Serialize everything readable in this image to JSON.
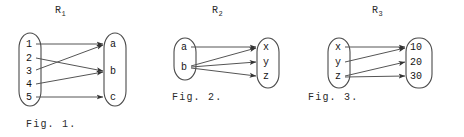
{
  "figures": [
    {
      "relation_label": "R",
      "relation_subscript": "1",
      "caption": "Fig. 1.",
      "domain_elements": [
        "1",
        "2",
        "3",
        "4",
        "5"
      ],
      "codomain_elements": [
        "a",
        "b",
        "c"
      ],
      "edges": [
        {
          "from": "1",
          "to": "a"
        },
        {
          "from": "2",
          "to": "b"
        },
        {
          "from": "3",
          "to": "a"
        },
        {
          "from": "4",
          "to": "b"
        },
        {
          "from": "5",
          "to": "c"
        }
      ]
    },
    {
      "relation_label": "R",
      "relation_subscript": "2",
      "caption": "Fig. 2.",
      "domain_elements": [
        "a",
        "b"
      ],
      "codomain_elements": [
        "x",
        "y",
        "z"
      ],
      "edges": [
        {
          "from": "a",
          "to": "x"
        },
        {
          "from": "b",
          "to": "x"
        },
        {
          "from": "b",
          "to": "y"
        },
        {
          "from": "b",
          "to": "z"
        }
      ]
    },
    {
      "relation_label": "R",
      "relation_subscript": "3",
      "caption": "Fig. 3.",
      "domain_elements": [
        "x",
        "y",
        "z"
      ],
      "codomain_elements": [
        "10",
        "20",
        "30"
      ],
      "edges": [
        {
          "from": "x",
          "to": "10"
        },
        {
          "from": "y",
          "to": "10"
        },
        {
          "from": "z",
          "to": "20"
        },
        {
          "from": "z",
          "to": "30"
        }
      ]
    }
  ],
  "colors": {
    "background": "#ffffff",
    "ink": "#1a1a1a",
    "stroke": "#555555",
    "oval": "#4a4a4a"
  }
}
